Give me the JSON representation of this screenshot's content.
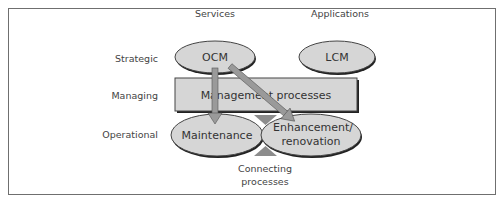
{
  "diagram": {
    "columns": [
      {
        "label": "Services"
      },
      {
        "label": "Applications"
      }
    ],
    "rows": [
      {
        "label": "Strategic"
      },
      {
        "label": "Managing"
      },
      {
        "label": "Operational"
      }
    ],
    "nodes": {
      "ocm": {
        "label": "OCM"
      },
      "lcm": {
        "label": "LCM"
      },
      "management": {
        "label": "Management processes"
      },
      "maintenance": {
        "label": "Maintenance"
      },
      "enhancement": {
        "line1": "Enhancement/",
        "line2": "renovation"
      }
    },
    "connecting": {
      "line1": "Connecting",
      "line2": "processes"
    },
    "edges": [
      {
        "from": "OCM",
        "to": "Maintenance"
      },
      {
        "from": "OCM",
        "to": "Enhancement/renovation"
      }
    ],
    "colors": {
      "fill": "#d6d6d6",
      "stroke": "#333333",
      "arrow": "#9a9a9a",
      "triangle": "#8c8c8c",
      "frame": "#6f6f6f"
    }
  }
}
